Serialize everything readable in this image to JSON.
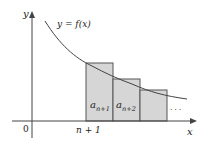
{
  "diagram": {
    "curve_label": "y = f(x)",
    "y_axis_label": "y",
    "x_axis_label": "x",
    "origin_label": "0",
    "x_tick_label": "n + 1",
    "rect_labels": [
      "a",
      "a"
    ],
    "rect_subscripts": [
      "n+1",
      "n+2"
    ],
    "ellipsis": "· · ·",
    "colors": {
      "rect_fill": "#d6d6d6",
      "stroke": "#444444",
      "curve": "#444444"
    }
  }
}
